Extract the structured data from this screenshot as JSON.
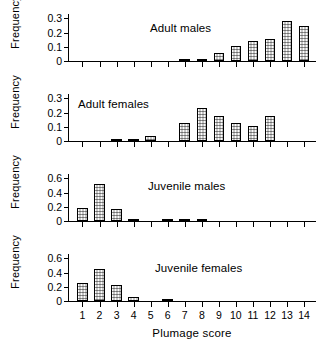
{
  "figure": {
    "xlabel": "Plumage score",
    "ylabel": "Frequency",
    "x_tick_labels": [
      "1",
      "2",
      "3",
      "4",
      "5",
      "6",
      "7",
      "8",
      "9",
      "10",
      "11",
      "12",
      "13",
      "14"
    ],
    "axis_color": "#000000",
    "bar_face_color": "#fbfbfb",
    "bar_edge_color": "#000000"
  },
  "chart_data": [
    {
      "type": "bar",
      "title": "Adult males",
      "xlabel": "",
      "ylabel": "Frequency",
      "categories": [
        1,
        2,
        3,
        4,
        5,
        6,
        7,
        8,
        9,
        10,
        11,
        12,
        13,
        14
      ],
      "values": [
        0,
        0,
        0,
        0,
        0,
        0,
        0.012,
        0.012,
        0.055,
        0.105,
        0.14,
        0.152,
        0.28,
        0.245
      ],
      "ylim": [
        0,
        0.33
      ],
      "yticks": [
        0,
        0.1,
        0.2,
        0.3
      ],
      "ytick_labels": [
        "0",
        "0.1",
        "0.2",
        "0.3"
      ],
      "grid": false,
      "legend": "none"
    },
    {
      "type": "bar",
      "title": "Adult females",
      "xlabel": "",
      "ylabel": "Frequency",
      "categories": [
        1,
        2,
        3,
        4,
        5,
        6,
        7,
        8,
        9,
        10,
        11,
        12,
        13,
        14
      ],
      "values": [
        0,
        0,
        0.017,
        0.017,
        0.035,
        0,
        0.125,
        0.235,
        0.175,
        0.127,
        0.103,
        0.178,
        0,
        0
      ],
      "ylim": [
        0,
        0.33
      ],
      "yticks": [
        0,
        0.1,
        0.2,
        0.3
      ],
      "ytick_labels": [
        "0",
        "0.1",
        "0.2",
        "0.3"
      ],
      "grid": false,
      "legend": "none"
    },
    {
      "type": "bar",
      "title": "Juvenile males",
      "xlabel": "",
      "ylabel": "Frequency",
      "categories": [
        1,
        2,
        3,
        4,
        5,
        6,
        7,
        8,
        9,
        10,
        11,
        12,
        13,
        14
      ],
      "values": [
        0.185,
        0.525,
        0.17,
        0.035,
        0,
        0.032,
        0.02,
        0.035,
        0,
        0,
        0,
        0,
        0,
        0
      ],
      "ylim": [
        0,
        0.66
      ],
      "yticks": [
        0,
        0.2,
        0.4,
        0.6
      ],
      "ytick_labels": [
        "0",
        "0.2",
        "0.4",
        "0.6"
      ],
      "grid": false,
      "legend": "none"
    },
    {
      "type": "bar",
      "title": "Juvenile females",
      "xlabel": "Plumage score",
      "ylabel": "Frequency",
      "categories": [
        1,
        2,
        3,
        4,
        5,
        6,
        7,
        8,
        9,
        10,
        11,
        12,
        13,
        14
      ],
      "values": [
        0.255,
        0.455,
        0.23,
        0.05,
        0,
        0.015,
        0,
        0,
        0,
        0,
        0,
        0,
        0,
        0
      ],
      "ylim": [
        0,
        0.66
      ],
      "yticks": [
        0,
        0.2,
        0.4,
        0.6
      ],
      "ytick_labels": [
        "0",
        "0.2",
        "0.4",
        "0.6"
      ],
      "grid": false,
      "legend": "none"
    }
  ]
}
